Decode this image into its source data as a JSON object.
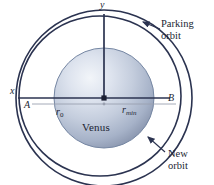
{
  "figure": {
    "background_color": "#ffffff",
    "width": 214,
    "height": 185
  },
  "colors": {
    "orbit_stroke": "#2b3350",
    "axis_stroke": "#2b3350",
    "dimension_line": "#9aa0b0",
    "planet_edge": "#6b7a96",
    "planet_light": "#eef1f6",
    "planet_mid": "#c2cbdb",
    "planet_dark": "#7d8aa6",
    "text": "#1b1f33",
    "leader_line": "#2b3350"
  },
  "axes": {
    "y_label": "y",
    "x_label": "x",
    "origin_marker": "center-dot"
  },
  "points": {
    "a_label": "A",
    "b_label": "B"
  },
  "dimensions": [
    {
      "name": "r-zero",
      "symbol": "r",
      "subscript": "0"
    },
    {
      "name": "r-min",
      "symbol": "r",
      "subscript": "min"
    }
  ],
  "planet": {
    "name": "Venus"
  },
  "callouts": [
    {
      "name": "parking-orbit",
      "line1": "Parking",
      "line2": "orbit"
    },
    {
      "name": "new-orbit",
      "line1": "New",
      "line2": "orbit"
    }
  ],
  "orbits": [
    {
      "name": "parking-orbit-curve",
      "style": "outer-circle"
    },
    {
      "name": "new-orbit-curve",
      "style": "inner-ellipse"
    }
  ]
}
